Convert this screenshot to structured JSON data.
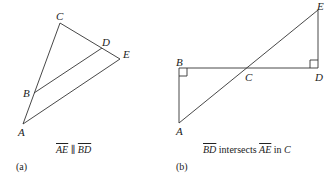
{
  "figure_a": {
    "points": {
      "A": {
        "label": "A",
        "x": 23,
        "y": 124
      },
      "B": {
        "label": "B",
        "x": 34,
        "y": 93
      },
      "C": {
        "label": "C",
        "x": 60,
        "y": 23
      },
      "D": {
        "label": "D",
        "x": 102,
        "y": 48
      },
      "E": {
        "label": "E",
        "x": 120,
        "y": 59
      }
    },
    "segments": [
      "AC",
      "CE",
      "AE",
      "BD"
    ],
    "caption": {
      "seg1": "AE",
      "rel": " ∥ ",
      "seg2": "BD"
    },
    "sublabel": "(a)"
  },
  "figure_b": {
    "points": {
      "A": {
        "label": "A",
        "x": 179,
        "y": 123
      },
      "B": {
        "label": "B",
        "x": 179,
        "y": 68
      },
      "C": {
        "label": "C",
        "x": 248,
        "y": 68
      },
      "D": {
        "label": "D",
        "x": 318,
        "y": 68
      },
      "E": {
        "label": "E",
        "x": 318,
        "y": 10
      }
    },
    "segments": [
      "AB",
      "BD",
      "DE",
      "AE"
    ],
    "right_angles": [
      "B",
      "D"
    ],
    "caption": {
      "seg1": "BD",
      "rel1": " intersects ",
      "seg2": "AE",
      "rel2": " in ",
      "pt": "C"
    },
    "sublabel": "(b)"
  },
  "colors": {
    "line": "#333333",
    "text": "#222222"
  }
}
